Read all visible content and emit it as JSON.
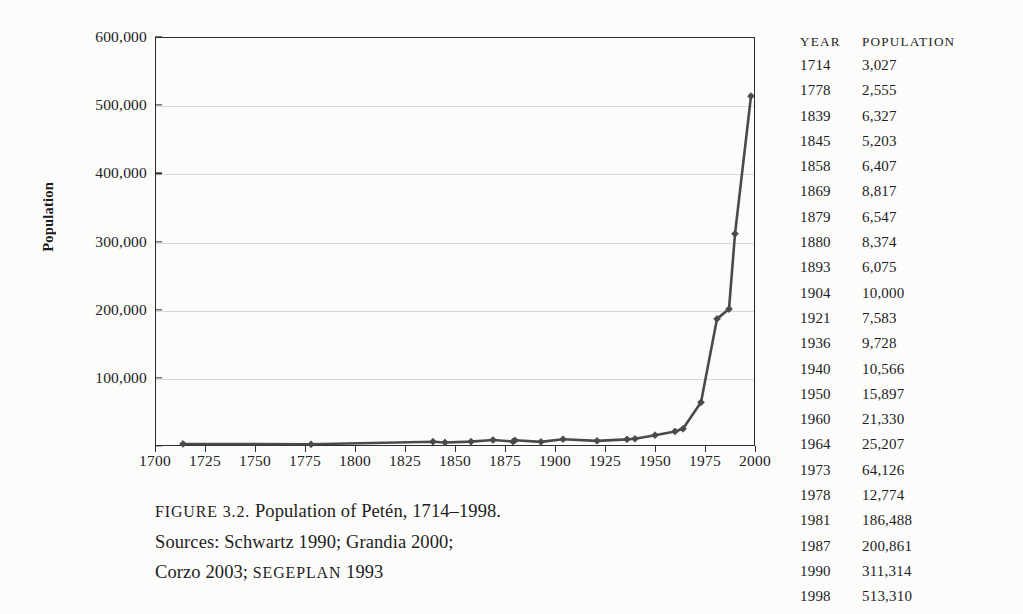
{
  "figure": {
    "caption_lines": [
      "FIGURE 3.2. Population of Petén, 1714–1998.",
      "Sources: Schwartz 1990; Grandia 2000;",
      "Corzo 2003; SEGEPLAN 1993"
    ],
    "caption_label": "FIGURE 3.2.",
    "caption_title": "Population of Petén, 1714–1998.",
    "sources_line_1": "Sources: Schwartz 1990; Grandia 2000;",
    "sources_line_2a": "Corzo 2003; ",
    "sources_line_2b": "SEGEPLAN",
    "sources_line_2c": " 1993"
  },
  "table": {
    "headers": [
      "YEAR",
      "POPULATION"
    ],
    "rows": [
      {
        "year": "1714",
        "population": "3,027"
      },
      {
        "year": "1778",
        "population": "2,555"
      },
      {
        "year": "1839",
        "population": "6,327"
      },
      {
        "year": "1845",
        "population": "5,203"
      },
      {
        "year": "1858",
        "population": "6,407"
      },
      {
        "year": "1869",
        "population": "8,817"
      },
      {
        "year": "1879",
        "population": "6,547"
      },
      {
        "year": "1880",
        "population": "8,374"
      },
      {
        "year": "1893",
        "population": "6,075"
      },
      {
        "year": "1904",
        "population": "10,000"
      },
      {
        "year": "1921",
        "population": "7,583"
      },
      {
        "year": "1936",
        "population": "9,728"
      },
      {
        "year": "1940",
        "population": "10,566"
      },
      {
        "year": "1950",
        "population": "15,897"
      },
      {
        "year": "1960",
        "population": "21,330"
      },
      {
        "year": "1964",
        "population": "25,207"
      },
      {
        "year": "1973",
        "population": "64,126"
      },
      {
        "year": "1978",
        "population": "12,774"
      },
      {
        "year": "1981",
        "population": "186,488"
      },
      {
        "year": "1987",
        "population": "200,861"
      },
      {
        "year": "1990",
        "population": "311,314"
      },
      {
        "year": "1998",
        "population": "513,310"
      }
    ]
  },
  "chart_data": {
    "type": "line",
    "title": "Population of Petén, 1714–1998",
    "xlabel": "",
    "ylabel": "Population",
    "xlim": [
      1700,
      2000
    ],
    "ylim": [
      0,
      600000
    ],
    "xticks": [
      1700,
      1725,
      1750,
      1775,
      1800,
      1825,
      1850,
      1875,
      1900,
      1925,
      1950,
      1975,
      2000
    ],
    "xtick_labels": [
      "1700",
      "1725",
      "1750",
      "1775",
      "1800",
      "1825",
      "1850",
      "1875",
      "1900",
      "1925",
      "1950",
      "1975",
      "2000"
    ],
    "yticks": [
      0,
      100000,
      200000,
      300000,
      400000,
      500000,
      600000
    ],
    "ytick_labels": [
      "",
      "100,000",
      "200,000",
      "300,000",
      "400,000",
      "500,000",
      "600,000"
    ],
    "grid": true,
    "legend": "none",
    "marker": "diamond",
    "line_color": "#4a4a4a",
    "grid_color": "#d8d8d4",
    "axis_color": "#2b2b2b",
    "x": [
      1714,
      1778,
      1839,
      1845,
      1858,
      1869,
      1879,
      1880,
      1893,
      1904,
      1921,
      1936,
      1940,
      1950,
      1960,
      1964,
      1973,
      1981,
      1987,
      1990,
      1998
    ],
    "values": [
      3027,
      2555,
      6327,
      5203,
      6407,
      8817,
      6547,
      8374,
      6075,
      10000,
      7583,
      9728,
      10566,
      15897,
      21330,
      25207,
      64126,
      186488,
      200861,
      311314,
      513310
    ],
    "note_omitted_point": "1978 (12,774) listed in table but not plotted on the curve"
  }
}
